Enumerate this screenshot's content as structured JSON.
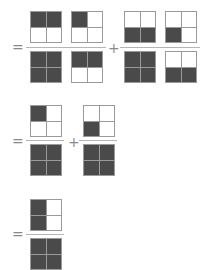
{
  "operators": {
    "equals": "=",
    "plus": "+"
  },
  "rows": [
    {
      "terms": [
        {
          "numerator": [
            1,
            1,
            0,
            0
          ],
          "denominator": [
            1,
            1,
            1,
            1
          ]
        },
        {
          "numerator": [
            1,
            0,
            0,
            0
          ],
          "denominator": [
            1,
            1,
            0,
            0
          ]
        },
        {
          "numerator": [
            0,
            0,
            1,
            1
          ],
          "denominator": [
            1,
            1,
            1,
            1
          ]
        },
        {
          "numerator": [
            0,
            0,
            1,
            0
          ],
          "denominator": [
            0,
            0,
            1,
            1
          ]
        }
      ],
      "operators_between": [
        "×",
        "+",
        "×"
      ]
    },
    {
      "terms": [
        {
          "numerator": [
            1,
            0,
            0,
            0
          ],
          "denominator": [
            1,
            1,
            1,
            1
          ]
        },
        {
          "numerator": [
            0,
            0,
            1,
            0
          ],
          "denominator": [
            1,
            1,
            1,
            1
          ]
        }
      ],
      "operators_between": [
        "+"
      ]
    },
    {
      "terms": [
        {
          "numerator": [
            1,
            0,
            1,
            0
          ],
          "denominator": [
            1,
            1,
            1,
            1
          ]
        }
      ]
    }
  ]
}
